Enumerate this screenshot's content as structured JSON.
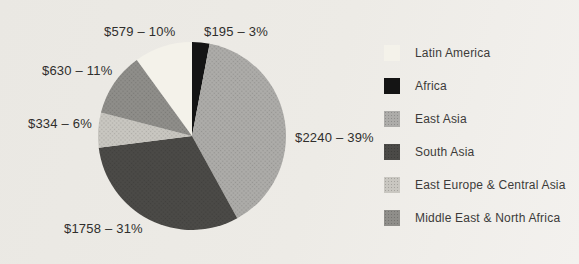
{
  "background_color": "#edebe6",
  "text_color": "#2f2e2c",
  "chart_data": {
    "type": "pie",
    "title": "",
    "legend_position": "right",
    "start_angle_deg": -36,
    "direction": "clockwise",
    "slices": [
      {
        "name": "Latin America",
        "value": 579,
        "pct": 10,
        "label": "$579 – 10%",
        "color": "#f4f2ea",
        "textured": false
      },
      {
        "name": "Africa",
        "value": 195,
        "pct": 3,
        "label": "$195 – 3%",
        "color": "#141414",
        "textured": false
      },
      {
        "name": "East Asia",
        "value": 2240,
        "pct": 39,
        "label": "$2240 – 39%",
        "color": "#adaca9",
        "textured": true
      },
      {
        "name": "South Asia",
        "value": 1758,
        "pct": 31,
        "label": "$1758 – 31%",
        "color": "#4b4a47",
        "textured": true
      },
      {
        "name": "East Europe & Central Asia",
        "value": 334,
        "pct": 6,
        "label": "$334 – 6%",
        "color": "#c9c7c1",
        "textured": true
      },
      {
        "name": "Middle East & North Africa",
        "value": 630,
        "pct": 11,
        "label": "$630 – 11%",
        "color": "#8f8e8a",
        "textured": true
      }
    ]
  }
}
